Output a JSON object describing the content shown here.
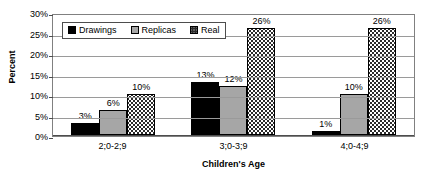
{
  "chart_data": {
    "type": "bar",
    "title": "",
    "xlabel": "Children's Age",
    "ylabel": "Percent",
    "categories": [
      "2;0-2;9",
      "3;0-3;9",
      "4;0-4;9"
    ],
    "series": [
      {
        "name": "Drawings",
        "values": [
          3,
          13,
          1
        ],
        "color": "#000000",
        "pattern": "solid-black"
      },
      {
        "name": "Replicas",
        "values": [
          6,
          12,
          10
        ],
        "color": "#a6a6a6",
        "pattern": "solid-gray"
      },
      {
        "name": "Real",
        "values": [
          10,
          26,
          26
        ],
        "color": "#ffffff",
        "pattern": "dotted"
      }
    ],
    "value_labels": [
      [
        "3%",
        "6%",
        "10%"
      ],
      [
        "13%",
        "12%",
        "26%"
      ],
      [
        "1%",
        "10%",
        "26%"
      ]
    ],
    "ylim": [
      0,
      30
    ],
    "ytick_values": [
      0,
      5,
      10,
      15,
      20,
      25,
      30
    ],
    "ytick_labels": [
      "0%",
      "5%",
      "10%",
      "15%",
      "20%",
      "25%",
      "30%"
    ],
    "grid": true,
    "legend_position": "top-left-inside",
    "legend_entries": [
      "Drawings",
      "Replicas",
      "Real"
    ]
  }
}
